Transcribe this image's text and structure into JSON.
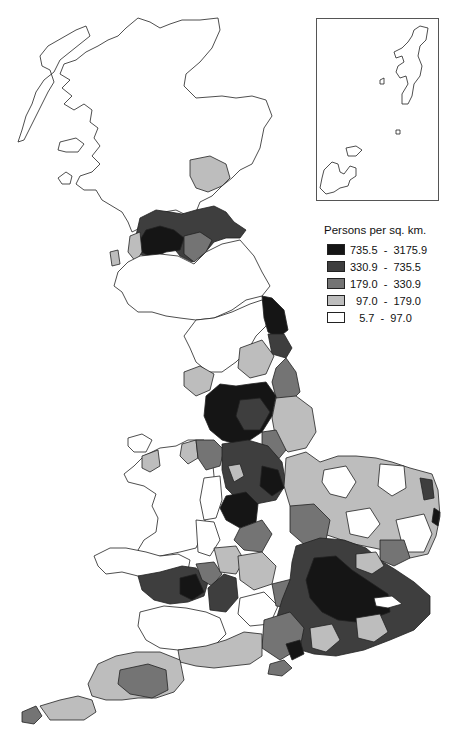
{
  "map": {
    "subject": "Population density of Great Britain by district",
    "inset": {
      "label": "Shetland and Orkney inset",
      "islands": [
        "Shetland",
        "Fair Isle",
        "Foula",
        "Orkney"
      ]
    },
    "legend": {
      "title": "Persons per sq. km.",
      "classes": [
        {
          "range": "735.5  -  3175.9",
          "min": 735.5,
          "max": 3175.9,
          "color": "#151515"
        },
        {
          "range": "330.9  -  735.5",
          "min": 330.9,
          "max": 735.5,
          "color": "#3e3e3e"
        },
        {
          "range": "179.0  -  330.9",
          "min": 179.0,
          "max": 330.9,
          "color": "#747474"
        },
        {
          "range": "  97.0  -  179.0",
          "min": 97.0,
          "max": 179.0,
          "color": "#bdbdbd"
        },
        {
          "range": "   5.7  -  97.0",
          "min": 5.7,
          "max": 97.0,
          "color": "#ffffff"
        }
      ]
    },
    "regions": {
      "highlands": "5.7 - 97.0",
      "central_belt_glasgow": "735.5 - 3175.9",
      "edinburgh_fife": "330.9 - 735.5",
      "north_east_england": "735.5 - 3175.9",
      "lancashire_yorkshire": "735.5 - 3175.9",
      "west_midlands": "735.5 - 3175.9",
      "london": "735.5 - 3175.9",
      "south_wales": "330.9 - 735.5",
      "central_wales": "5.7 - 97.0",
      "cornwall_devon": "97.0 - 179.0"
    }
  }
}
